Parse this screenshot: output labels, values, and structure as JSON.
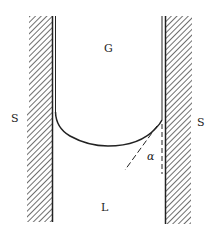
{
  "diagram": {
    "labels": {
      "gas": "G",
      "liquid": "L",
      "solid_left": "S",
      "solid_right": "S",
      "contact_angle": "α"
    },
    "colors": {
      "ink": "#222222",
      "background": "#ffffff"
    }
  }
}
